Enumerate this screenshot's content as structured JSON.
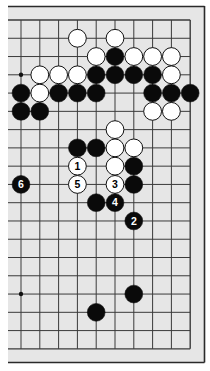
{
  "diagram": {
    "type": "go-board-partial",
    "colors": {
      "page_bg": "#ffffff",
      "board_bg": "#e6e6e6",
      "frame": "#2a2a2a",
      "grid": "#3a3a3a",
      "black_stone": "#0a0a0a",
      "white_stone": "#ffffff",
      "stone_outline": "#111111"
    },
    "grid": {
      "cols": 10,
      "rows": 19,
      "x0": 21,
      "dx": 18.8,
      "y0": 20,
      "dy": 18.27
    },
    "hoshi": [
      {
        "c": 0,
        "r": 3
      },
      {
        "c": 0,
        "r": 15
      }
    ],
    "stones": [
      {
        "c": 3,
        "r": 1,
        "color": "white"
      },
      {
        "c": 5,
        "r": 1,
        "color": "white"
      },
      {
        "c": 4,
        "r": 2,
        "color": "white"
      },
      {
        "c": 5,
        "r": 2,
        "color": "black"
      },
      {
        "c": 6,
        "r": 2,
        "color": "white"
      },
      {
        "c": 7,
        "r": 2,
        "color": "white"
      },
      {
        "c": 8,
        "r": 2,
        "color": "white"
      },
      {
        "c": 1,
        "r": 3,
        "color": "white"
      },
      {
        "c": 2,
        "r": 3,
        "color": "white"
      },
      {
        "c": 3,
        "r": 3,
        "color": "white"
      },
      {
        "c": 4,
        "r": 3,
        "color": "black"
      },
      {
        "c": 5,
        "r": 3,
        "color": "black"
      },
      {
        "c": 6,
        "r": 3,
        "color": "black"
      },
      {
        "c": 7,
        "r": 3,
        "color": "black"
      },
      {
        "c": 8,
        "r": 3,
        "color": "white"
      },
      {
        "c": 0,
        "r": 4,
        "color": "black"
      },
      {
        "c": 1,
        "r": 4,
        "color": "white"
      },
      {
        "c": 2,
        "r": 4,
        "color": "black"
      },
      {
        "c": 3,
        "r": 4,
        "color": "black"
      },
      {
        "c": 4,
        "r": 4,
        "color": "black"
      },
      {
        "c": 7,
        "r": 4,
        "color": "black"
      },
      {
        "c": 8,
        "r": 4,
        "color": "black"
      },
      {
        "c": 9,
        "r": 4,
        "color": "black"
      },
      {
        "c": 0,
        "r": 5,
        "color": "black"
      },
      {
        "c": 1,
        "r": 5,
        "color": "black"
      },
      {
        "c": 7,
        "r": 5,
        "color": "white"
      },
      {
        "c": 8,
        "r": 5,
        "color": "white"
      },
      {
        "c": 5,
        "r": 6,
        "color": "white"
      },
      {
        "c": 3,
        "r": 7,
        "color": "black"
      },
      {
        "c": 4,
        "r": 7,
        "color": "black"
      },
      {
        "c": 5,
        "r": 7,
        "color": "white"
      },
      {
        "c": 6,
        "r": 7,
        "color": "white"
      },
      {
        "c": 3,
        "r": 8,
        "color": "white",
        "label": "1"
      },
      {
        "c": 5,
        "r": 8,
        "color": "white"
      },
      {
        "c": 6,
        "r": 8,
        "color": "black"
      },
      {
        "c": 0,
        "r": 9,
        "color": "black",
        "label": "6"
      },
      {
        "c": 3,
        "r": 9,
        "color": "white",
        "label": "5"
      },
      {
        "c": 5,
        "r": 9,
        "color": "white",
        "label": "3"
      },
      {
        "c": 6,
        "r": 9,
        "color": "black"
      },
      {
        "c": 4,
        "r": 10,
        "color": "black"
      },
      {
        "c": 5,
        "r": 10,
        "color": "black",
        "label": "4"
      },
      {
        "c": 6,
        "r": 11,
        "color": "black",
        "label": "2"
      },
      {
        "c": 6,
        "r": 15,
        "color": "black"
      },
      {
        "c": 4,
        "r": 16,
        "color": "black"
      }
    ],
    "move_labels": [
      "1",
      "2",
      "3",
      "4",
      "5",
      "6"
    ]
  }
}
